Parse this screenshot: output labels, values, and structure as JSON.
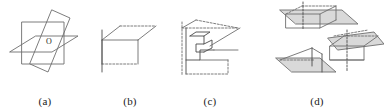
{
  "figure": {
    "background_color": "#ffffff",
    "line_color": "#6e6e6e",
    "dark_line_color": "#4a4a4a",
    "shade_color": "#d9d9d9",
    "text_color": "#1a1a1a",
    "panels": [
      {
        "id": "panel-a",
        "caption": "(a)",
        "description": "Three mutually perpendicular planes intersecting at a common point",
        "point_label": "O",
        "plane_count": 3,
        "shaded": false
      },
      {
        "id": "panel-b",
        "caption": "(b)",
        "description": "A horizontal plane with a vertical plane and a line piercing it",
        "point_label": "",
        "plane_count": 2,
        "shaded": false
      },
      {
        "id": "panel-c",
        "caption": "(c)",
        "description": "A plane with a folded stepped surface and intersecting lines",
        "point_label": "",
        "plane_count": 3,
        "shaded": false
      },
      {
        "id": "panel-d",
        "caption": "(d)",
        "description": "Three small shaded plane-and-line configurations",
        "point_label": "",
        "plane_count": 3,
        "shaded": true,
        "subfigures": [
          {
            "id": "panel-d-top",
            "description": "Shaded plane with vertical dashed line through a box"
          },
          {
            "id": "panel-d-left",
            "description": "Shaded plane with slanted line and vertical edge"
          },
          {
            "id": "panel-d-right",
            "description": "Shaded plane with box and vertical dashed line below"
          }
        ]
      }
    ]
  }
}
